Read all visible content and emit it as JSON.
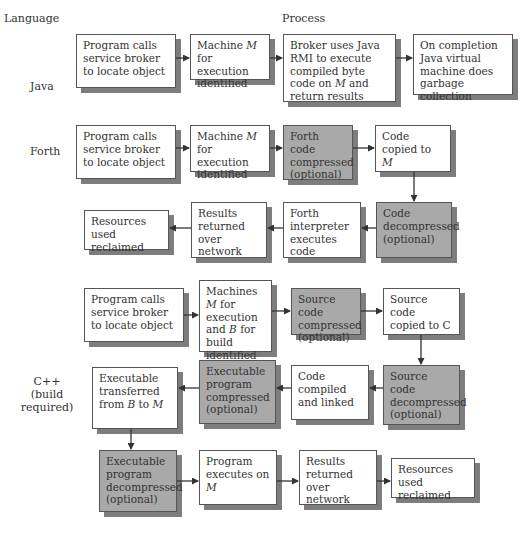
{
  "headers": {
    "language": "Language",
    "process": "Process"
  },
  "rows": {
    "java": {
      "label": "Java",
      "steps": [
        "Program calls service broker to locate object",
        "Machine M for execution identified",
        "Broker uses Java RMI to execute compiled byte code on M and return results",
        "On completion Java virtual machine does garbage collection"
      ]
    },
    "forth": {
      "label": "Forth",
      "steps": [
        "Program calls service broker to locate object",
        "Machine M for execution identified",
        "Forth code compressed (optional)",
        "Code copied to M",
        "Code decompressed (optional)",
        "Forth interpreter executes code",
        "Results returned over network",
        "Resources used reclaimed"
      ]
    },
    "cpp": {
      "label_line1": "C++",
      "label_line2": "(build required)",
      "steps": [
        "Program calls service broker to locate object",
        "Machines M for execution and B for build identified",
        "Source code compressed (optional)",
        "Source code copied to C",
        "Source code decompressed (optional)",
        "Code compiled and linked",
        "Executable program compressed (optional)",
        "Executable transferred from B to M",
        "Executable program decompressed (optional)",
        "Program executes on M",
        "Results returned over network",
        "Resources used reclaimed"
      ]
    }
  },
  "colors": {
    "plain_box": "#ffffff",
    "optional_box": "#a9a9a9",
    "shadow": "#7d7d7d",
    "border": "#555555"
  }
}
